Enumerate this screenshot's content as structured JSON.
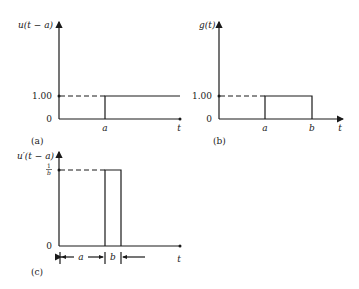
{
  "panels": [
    {
      "id": "a",
      "caption": "(a)",
      "y_axis_label": "u(t − a)",
      "x_axis_label": "t",
      "y_ticks": [
        "0",
        "1.00"
      ],
      "x_ticks": [
        "a"
      ],
      "description": "Unit step function delayed by a"
    },
    {
      "id": "b",
      "caption": "(b)",
      "y_axis_label": "g(t)",
      "x_axis_label": "t",
      "y_ticks": [
        "0",
        "1.00"
      ],
      "x_ticks": [
        "a",
        "b"
      ],
      "description": "Rectangular pulse of height 1.00 from a to b"
    },
    {
      "id": "c",
      "caption": "(c)",
      "y_axis_label": "u′(t − a)",
      "x_axis_label": "t",
      "y_ticks": [
        "0",
        "1/b"
      ],
      "y_tick_num": "1",
      "y_tick_den": "b",
      "x_interval_labels": [
        "a",
        "b"
      ],
      "description": "Pulse of height 1/b and width b starting at a"
    }
  ],
  "colors": {
    "ink": "#1a1a1a",
    "background": "#ffffff"
  }
}
